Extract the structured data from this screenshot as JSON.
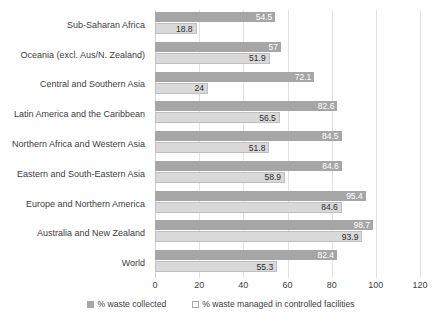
{
  "chart_data": {
    "type": "bar",
    "orientation": "horizontal",
    "title": "",
    "xlabel": "",
    "ylabel": "",
    "xlim": [
      0,
      120
    ],
    "xticks": [
      0,
      20,
      40,
      60,
      80,
      100,
      120
    ],
    "grid": true,
    "legend_position": "bottom",
    "categories": [
      "Sub-Saharan Africa",
      "Oceania (excl. Aus/N. Zealand)",
      "Central and Southern Asia",
      "Latin America and the Caribbean",
      "Northern Africa and Western Asia",
      "Eastern and South-Eastern Asia",
      "Europe and Northern America",
      "Australia and New Zealand",
      "World"
    ],
    "series": [
      {
        "name": "% waste collected",
        "color": "#a6a6a6",
        "values": [
          54.5,
          57,
          72.1,
          82.6,
          84.5,
          84.6,
          95.4,
          98.7,
          82.4
        ],
        "labels": [
          "54.5",
          "57",
          "72.1",
          "82.6",
          "84.5",
          "84.6",
          "95.4",
          "98.7",
          "82.4"
        ]
      },
      {
        "name": "% waste managed in controlled facilities",
        "color": "#d9d9d9",
        "values": [
          18.8,
          51.9,
          24,
          56.5,
          51.8,
          58.9,
          84.6,
          93.9,
          55.3
        ],
        "labels": [
          "18.8",
          "51.9",
          "24",
          "56.5",
          "51.8",
          "58.9",
          "84.6",
          "93.9",
          "55.3"
        ]
      }
    ]
  }
}
